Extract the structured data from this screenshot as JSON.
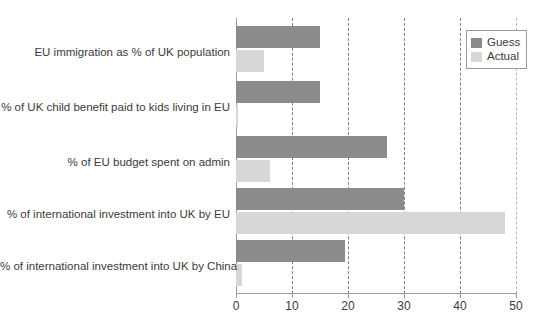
{
  "chart_data": {
    "type": "bar",
    "orientation": "horizontal",
    "title": "",
    "xlabel": "",
    "ylabel": "",
    "xlim": [
      0,
      50
    ],
    "xticks": [
      0,
      10,
      20,
      30,
      40,
      50
    ],
    "xtick_labels": [
      "0",
      "10",
      "20",
      "30",
      "40",
      "50"
    ],
    "grid": "vertical-dashed",
    "legend_position": "top-right",
    "categories": [
      "EU immigration as % of UK population",
      "% of UK child benefit paid to kids living in EU",
      "% of EU budget spent on admin",
      "% of international investment into UK by EU",
      "% of international investment into UK by China"
    ],
    "series": [
      {
        "name": "Guess",
        "color": "#8b8b8b",
        "values": [
          15,
          15,
          27,
          30,
          19.5
        ]
      },
      {
        "name": "Actual",
        "color": "#d7d7d7",
        "values": [
          5,
          0.3,
          6,
          48,
          1
        ]
      }
    ]
  },
  "legend": {
    "items": [
      {
        "label": "Guess",
        "color": "#8b8b8b"
      },
      {
        "label": "Actual",
        "color": "#d7d7d7"
      }
    ]
  }
}
